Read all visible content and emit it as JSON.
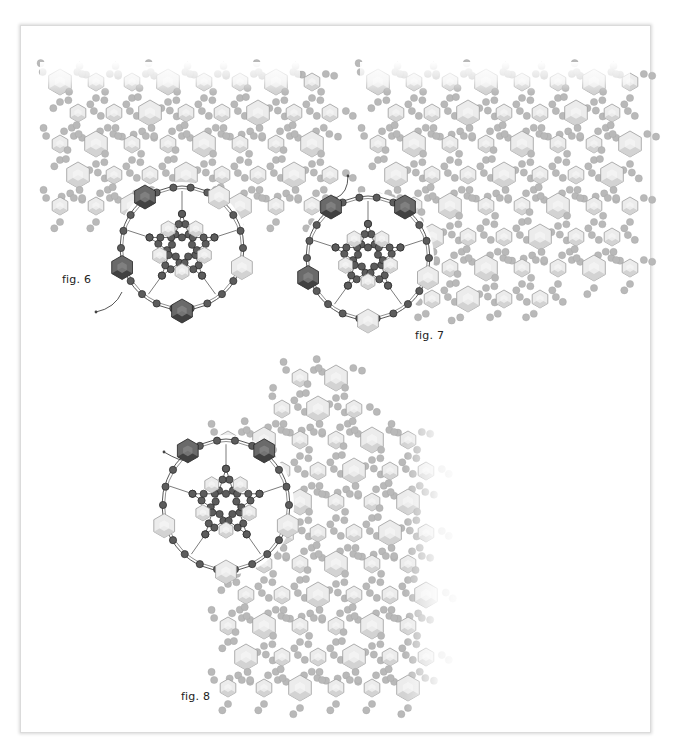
{
  "figures": [
    {
      "id": "fig6",
      "label": "fig. 6",
      "label_pos": [
        62,
        273
      ],
      "ball": {
        "cx": 182,
        "cy": 248,
        "rx": 62,
        "ry": 62
      },
      "exit_arrow": {
        "from": [
          122,
          292
        ],
        "to": [
          96,
          312
        ]
      },
      "background_origin": [
        48,
        75
      ],
      "background_cols": 9,
      "background_rows": 5
    },
    {
      "id": "fig7",
      "label": "fig. 7",
      "label_pos": [
        415,
        329
      ],
      "ball": {
        "cx": 368,
        "cy": 258,
        "rx": 62,
        "ry": 62
      },
      "exit_arrow": {
        "from": [
          336,
          198
        ],
        "to": [
          348,
          176
        ]
      },
      "background_origin": [
        362,
        80
      ],
      "background_cols": 9,
      "background_rows": 8
    },
    {
      "id": "fig8",
      "label": "fig. 8",
      "label_pos": [
        181,
        690
      ],
      "ball": {
        "cx": 226,
        "cy": 505,
        "rx": 64,
        "ry": 66
      },
      "exit_arrow": {
        "from": [
          186,
          460
        ],
        "to": [
          164,
          452
        ]
      },
      "background_origin": [
        212,
        380
      ],
      "background_cols": 8,
      "background_rows": 12
    }
  ],
  "colors": {
    "seed_dark": "#5c5c5c",
    "seed_dark_stroke": "#2a2a2a",
    "seed_light": "#b9b9b9",
    "crystal_light_fill": "#ececec",
    "crystal_light_shade": "#cfcfcf",
    "crystal_light_stroke": "#9c9c9c",
    "crystal_dark_fill": "#6a6a6a",
    "crystal_dark_shade": "#3a3a3a",
    "thread": "#444444",
    "frame_shadow": "#d9d9d9"
  }
}
